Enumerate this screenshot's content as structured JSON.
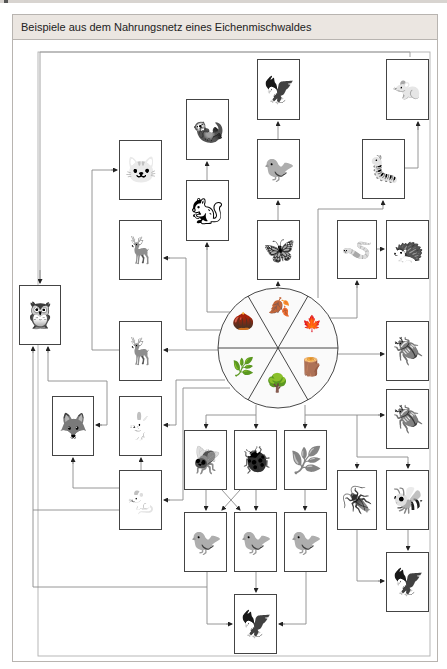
{
  "title": "Beispiele aus dem Nahrungsnetz eines Eichenmischwaldes",
  "colors": {
    "header_bg": "#ebe6e1",
    "frame": "#b8b4b0",
    "line": "#888888",
    "box_border": "#444444"
  },
  "center": {
    "name": "Eiche (Oak) resources",
    "segments": [
      {
        "name": "Eicheln",
        "glyph": "🌰"
      },
      {
        "name": "Eichenblatt",
        "glyph": "🍂"
      },
      {
        "name": "Laubstreu",
        "glyph": "🍁"
      },
      {
        "name": "Holz / Rinde",
        "glyph": "🪵"
      },
      {
        "name": "Baumstumpf",
        "glyph": "🌳"
      },
      {
        "name": "Kräuter",
        "glyph": "🌿"
      }
    ]
  },
  "nodes": [
    {
      "id": "sperber",
      "name": "Sperber",
      "glyph": "🦅"
    },
    {
      "id": "maulwurf",
      "name": "Maulwurf",
      "glyph": "🐀"
    },
    {
      "id": "marder",
      "name": "Marder",
      "glyph": "🦦"
    },
    {
      "id": "meise",
      "name": "Meise",
      "glyph": "🐦"
    },
    {
      "id": "hundertfuesser",
      "name": "Hundertfüßer",
      "glyph": "🐛"
    },
    {
      "id": "wildkatze",
      "name": "Wildkatze",
      "glyph": "🐱"
    },
    {
      "id": "eichhoernchen",
      "name": "Eichhörnchen",
      "glyph": "🐿"
    },
    {
      "id": "hirsch",
      "name": "Rothirsch",
      "glyph": "🦌"
    },
    {
      "id": "falter",
      "name": "Falter",
      "glyph": "🦋"
    },
    {
      "id": "regenwurm",
      "name": "Regenwurm",
      "glyph": "🪱"
    },
    {
      "id": "igel",
      "name": "Igel",
      "glyph": "🦔"
    },
    {
      "id": "kauz",
      "name": "Waldkauz",
      "glyph": "🦉"
    },
    {
      "id": "reh",
      "name": "Reh",
      "glyph": "🦌"
    },
    {
      "id": "hirschkaefer",
      "name": "Hirschkäfer",
      "glyph": "🪲"
    },
    {
      "id": "fuchs",
      "name": "Fuchs",
      "glyph": "🦊"
    },
    {
      "id": "hase",
      "name": "Hase",
      "glyph": "🐇"
    },
    {
      "id": "bockkaefer",
      "name": "Bockkäfer",
      "glyph": "🪲"
    },
    {
      "id": "fliege",
      "name": "Fliege",
      "glyph": "🪰"
    },
    {
      "id": "kaefer",
      "name": "Käfer",
      "glyph": "🐞"
    },
    {
      "id": "mistel",
      "name": "Mistel",
      "glyph": "🌿"
    },
    {
      "id": "maus",
      "name": "Maus",
      "glyph": "🐁"
    },
    {
      "id": "grossbock",
      "name": "Großer Bockkäfer",
      "glyph": "🪳"
    },
    {
      "id": "hornisse",
      "name": "Hornisse",
      "glyph": "🐝"
    },
    {
      "id": "specht",
      "name": "Specht",
      "glyph": "🐦"
    },
    {
      "id": "kleiber",
      "name": "Kleiber",
      "glyph": "🐦"
    },
    {
      "id": "drossel",
      "name": "Drossel",
      "glyph": "🐦"
    },
    {
      "id": "bussard",
      "name": "Bussard",
      "glyph": "🦅"
    },
    {
      "id": "falke",
      "name": "Falke",
      "glyph": "🦅"
    }
  ]
}
